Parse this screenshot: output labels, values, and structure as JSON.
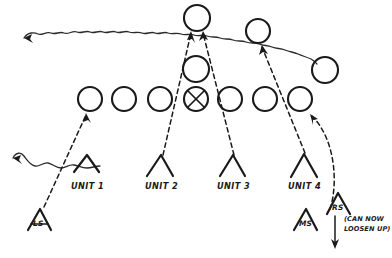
{
  "diagram": {
    "type": "hand-drawn-tactical-formation-diagram",
    "background_color": "#ffffff",
    "ink_color": "#1a1a1a",
    "labels": {
      "unit_1": "UNIT 1",
      "unit_2": "UNIT 2",
      "unit_3": "UNIT 3",
      "unit_4": "UNIT 4",
      "ls": "LS",
      "ms": "MS",
      "rs": "RS",
      "note_line_1": "(CAN NOW",
      "note_line_2": "LOOSEN UP)"
    },
    "units": [
      {
        "id": "unit-1",
        "label": "UNIT 1",
        "x": 86,
        "y": 168
      },
      {
        "id": "unit-2",
        "label": "UNIT 2",
        "x": 160,
        "y": 168
      },
      {
        "id": "unit-3",
        "label": "UNIT 3",
        "x": 232,
        "y": 168
      },
      {
        "id": "unit-4",
        "label": "UNIT 4",
        "x": 303,
        "y": 168
      }
    ],
    "station_markers": [
      {
        "id": "ls",
        "label": "LS",
        "x": 38,
        "y": 221
      },
      {
        "id": "ms",
        "label": "MS",
        "x": 305,
        "y": 221
      },
      {
        "id": "rs",
        "label": "RS",
        "x": 338,
        "y": 205
      }
    ],
    "circle_row": {
      "count": 7,
      "cy": 99,
      "radius": 12,
      "cx_values": [
        90,
        124,
        160,
        196,
        230,
        265,
        300
      ],
      "marked_index": 3,
      "marked_style": "crossed-circle"
    },
    "extra_circles": [
      {
        "id": "circle-top",
        "cx": 197,
        "cy": 18,
        "r": 13
      },
      {
        "id": "circle-upper-right",
        "cx": 258,
        "cy": 31,
        "r": 12
      },
      {
        "id": "circle-mid",
        "cx": 196,
        "cy": 69,
        "r": 13
      },
      {
        "id": "circle-far-right",
        "cx": 325,
        "cy": 70,
        "r": 13
      }
    ],
    "connectors": [
      {
        "id": "ls-to-circle-1",
        "style": "dashed",
        "from": "LS",
        "to": "circle-row-1"
      },
      {
        "id": "unit2-to-top-circle",
        "style": "dashed",
        "from": "UNIT 2",
        "to": "circle-top"
      },
      {
        "id": "unit3-to-top-circle",
        "style": "dashed",
        "from": "UNIT 3",
        "to": "circle-top"
      },
      {
        "id": "unit4-to-upper-right-circle",
        "style": "dashed",
        "from": "UNIT 4",
        "to": "circle-upper-right"
      },
      {
        "id": "rs-to-circle-7",
        "style": "dashed-curved",
        "from": "RS",
        "to": "circle-row-7"
      },
      {
        "id": "wavy-top",
        "style": "wavy",
        "direction": "leftward"
      },
      {
        "id": "wavy-left",
        "style": "wavy",
        "direction": "leftward"
      },
      {
        "id": "rs-down-arrow",
        "style": "solid",
        "direction": "down"
      }
    ]
  }
}
